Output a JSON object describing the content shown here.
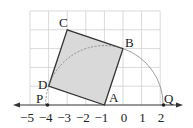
{
  "diagram": {
    "type": "geometry-number-line",
    "grid": {
      "x_min": -5,
      "x_max": 2,
      "y_min": 0,
      "y_max": 5
    },
    "number_line": {
      "ticks": [
        {
          "value": -5,
          "label": "−5"
        },
        {
          "value": -4,
          "label": "−4"
        },
        {
          "value": -3,
          "label": "−3"
        },
        {
          "value": -2,
          "label": "−2"
        },
        {
          "value": -1,
          "label": "−1"
        },
        {
          "value": 0,
          "label": "0"
        },
        {
          "value": 1,
          "label": "1"
        },
        {
          "value": 2,
          "label": "2"
        }
      ]
    },
    "points": {
      "A": {
        "label": "A",
        "x": -1,
        "y": 0
      },
      "B": {
        "label": "B",
        "x": 0,
        "y": 3
      },
      "C": {
        "label": "C",
        "x": -3,
        "y": 4
      },
      "D": {
        "label": "D",
        "x": -4,
        "y": 1
      },
      "P": {
        "label": "P",
        "x": -4.16,
        "y": 0
      },
      "Q": {
        "label": "Q",
        "x": 2.16,
        "y": 0
      }
    },
    "square": [
      "A",
      "B",
      "C",
      "D"
    ],
    "arc": {
      "center": "A",
      "through": "B",
      "from": "P",
      "to": "Q"
    },
    "colors": {
      "grid": "#cfcfcf",
      "square_fill": "#d9d9d9",
      "square_stroke": "#333333",
      "arc": "#888888",
      "axis": "#333333"
    }
  }
}
